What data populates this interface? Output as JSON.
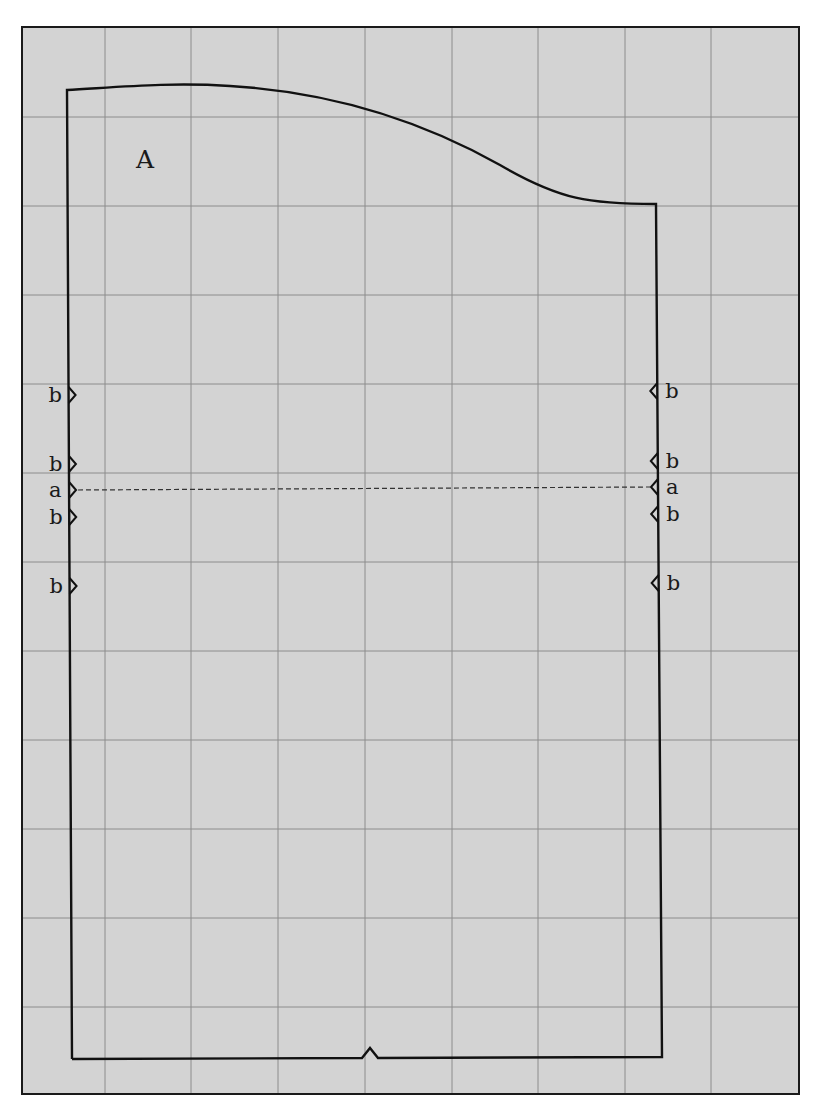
{
  "diagram": {
    "colors": {
      "paper": "#ffffff",
      "grid_background": "#d3d3d3",
      "grid_line": "#8c8c8c",
      "outline": "#111111"
    },
    "frame": {
      "x1": 22,
      "y1": 27,
      "x2": 799,
      "y2": 1094
    },
    "grid": {
      "vertical_x": [
        105,
        191,
        278,
        365,
        452,
        538,
        625,
        711
      ],
      "horizontal_y": [
        117,
        206,
        295,
        384,
        473,
        562,
        651,
        740,
        829,
        918,
        1007
      ]
    },
    "piece": {
      "label": "A",
      "label_pos": {
        "x": 136,
        "y": 168
      },
      "outline_path": "M 72 1059 L 67 90 C 120 87, 170 82, 230 86 C 330 92, 420 120, 500 165 C 560 200, 590 204, 656 204 L 662 1057 L 378 1058 L 370 1048 L 362 1058 L 72 1059"
    },
    "fold_line": {
      "label": "a",
      "x1": 78,
      "y1": 490,
      "x2": 650,
      "y2": 487
    },
    "notches": {
      "left": [
        {
          "label": "b",
          "y": 395
        },
        {
          "label": "b",
          "y": 464
        },
        {
          "label": "a",
          "y": 490
        },
        {
          "label": "b",
          "y": 517
        },
        {
          "label": "b",
          "y": 586
        }
      ],
      "right": [
        {
          "label": "b",
          "y": 391
        },
        {
          "label": "b",
          "y": 461
        },
        {
          "label": "a",
          "y": 487
        },
        {
          "label": "b",
          "y": 514
        },
        {
          "label": "b",
          "y": 583
        }
      ]
    },
    "bottom_notch": {
      "x": 370,
      "y": 1058
    }
  }
}
